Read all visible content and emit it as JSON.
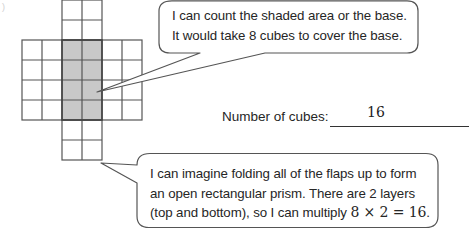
{
  "figure": {
    "net": {
      "cell_size": 20,
      "top_flap": {
        "cols": 2,
        "rows": 2
      },
      "body": {
        "cols": 6,
        "rows": 4,
        "shaded_cols": [
          2,
          3
        ]
      },
      "bottom_flap": {
        "cols": 2,
        "rows": 2
      },
      "shade_color": "#c8c8c8",
      "line_color": "#555555"
    }
  },
  "bubble_top": {
    "lines": [
      "I can count the shaded area or the base.",
      "It would take 8 cubes to cover the base."
    ]
  },
  "answer": {
    "label": "Number of cubes:",
    "value": "16"
  },
  "bubble_bottom": {
    "line1": "I can imagine folding all of the flaps up to form",
    "line2": "an open rectangular prism.  There are 2 layers",
    "line3_prefix": "(top and bottom), so I can multiply ",
    "line3_math": "8 × 2 = 16",
    "line3_suffix": "."
  },
  "artifact": ")"
}
